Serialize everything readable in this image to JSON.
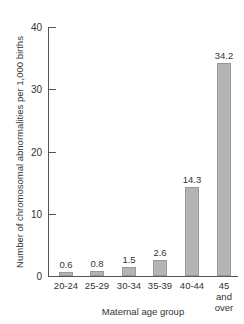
{
  "chart_data": {
    "type": "bar",
    "title": "",
    "xlabel": "Maternal age group",
    "ylabel": "Number of chromosomal abnormalities per 1,000 births",
    "categories": [
      "20-24",
      "25-29",
      "30-34",
      "35-39",
      "40-44",
      "45 and over"
    ],
    "values": [
      0.6,
      0.8,
      1.5,
      2.6,
      14.3,
      34.2
    ],
    "value_labels": [
      "0.6",
      "0.8",
      "1.5",
      "2.6",
      "14.3",
      "34.2"
    ],
    "ylim": [
      0,
      40
    ],
    "yticks": [
      0,
      10,
      20,
      30,
      40
    ],
    "grid": false,
    "legend": null,
    "bar_color": "#b4b4b4"
  },
  "axis": {
    "ytick_labels": [
      "0",
      "10",
      "20",
      "30",
      "40"
    ],
    "cat_lines": [
      [
        "20-24"
      ],
      [
        "25-29"
      ],
      [
        "30-34"
      ],
      [
        "35-39"
      ],
      [
        "40-44"
      ],
      [
        "45",
        "and",
        "over"
      ]
    ]
  }
}
